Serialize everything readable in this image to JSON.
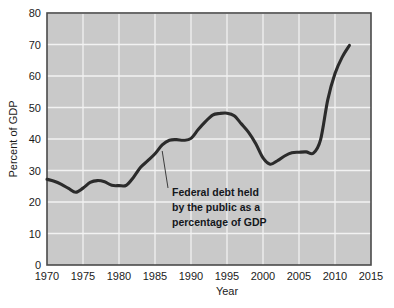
{
  "chart_data": {
    "type": "line",
    "title": "",
    "xlabel": "Year",
    "ylabel": "Percent of GDP",
    "xlim": [
      1970,
      2015
    ],
    "ylim": [
      0,
      80
    ],
    "grid": true,
    "legend": "none",
    "x_ticks": [
      "1970",
      "1975",
      "1980",
      "1985",
      "1990",
      "1995",
      "2000",
      "2005",
      "2010",
      "2015"
    ],
    "y_ticks": [
      "0",
      "10",
      "20",
      "30",
      "40",
      "50",
      "60",
      "70",
      "80"
    ],
    "series": [
      {
        "name": "Federal debt held by the public as a percentage of GDP",
        "x": [
          1970,
          1971,
          1972,
          1973,
          1974,
          1975,
          1976,
          1977,
          1978,
          1979,
          1980,
          1981,
          1982,
          1983,
          1984,
          1985,
          1986,
          1987,
          1988,
          1989,
          1990,
          1991,
          1992,
          1993,
          1994,
          1995,
          1996,
          1997,
          1998,
          1999,
          2000,
          2001,
          2002,
          2003,
          2004,
          2005,
          2006,
          2007,
          2008,
          2009,
          2010,
          2011,
          2012
        ],
        "values": [
          27.2,
          26.6,
          25.6,
          24.3,
          23.1,
          24.4,
          26.2,
          26.8,
          26.4,
          25.3,
          25.2,
          25.3,
          27.8,
          31.0,
          33.1,
          35.3,
          38.1,
          39.6,
          39.8,
          39.6,
          40.2,
          43.0,
          45.5,
          47.6,
          48.1,
          48.2,
          47.4,
          44.8,
          42.1,
          38.5,
          34.0,
          32.0,
          33.1,
          34.6,
          35.6,
          35.8,
          35.9,
          35.5,
          39.8,
          52.5,
          60.8,
          66.0,
          69.7
        ]
      }
    ],
    "annotation": {
      "lines": [
        "Federal debt held",
        "by the public as a",
        "percentage of GDP"
      ],
      "pointer_x": 1986,
      "pointer_y": 36.2
    },
    "colors": {
      "line": "#2b2b2b",
      "plot_background": "#c9c9c9",
      "gridline": "#f2f2f2",
      "border": "#4a4a4a",
      "text": "#1b1b1b",
      "figure_background": "#ffffff"
    }
  }
}
